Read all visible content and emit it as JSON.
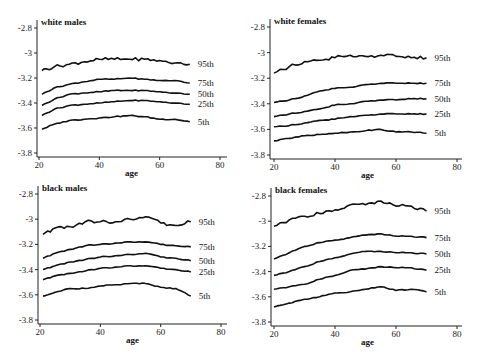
{
  "chart_data": [
    {
      "type": "line",
      "title": "white males",
      "xlabel": "age",
      "ylabel": "",
      "xlim": [
        20,
        80
      ],
      "ylim": [
        -3.8,
        -2.8
      ],
      "xticks": [
        20,
        40,
        60,
        80
      ],
      "yticks": [
        -2.8,
        -3,
        -3.2,
        -3.4,
        -3.6,
        -3.8
      ],
      "x": [
        21,
        25,
        30,
        35,
        40,
        45,
        50,
        55,
        60,
        65,
        70
      ],
      "series": [
        {
          "name": "95th",
          "values": [
            -3.14,
            -3.11,
            -3.09,
            -3.07,
            -3.05,
            -3.05,
            -3.05,
            -3.05,
            -3.06,
            -3.08,
            -3.09
          ]
        },
        {
          "name": "75th",
          "values": [
            -3.33,
            -3.28,
            -3.25,
            -3.23,
            -3.21,
            -3.21,
            -3.2,
            -3.21,
            -3.22,
            -3.22,
            -3.24
          ]
        },
        {
          "name": "50th",
          "values": [
            -3.42,
            -3.37,
            -3.33,
            -3.32,
            -3.31,
            -3.3,
            -3.3,
            -3.3,
            -3.31,
            -3.32,
            -3.33
          ]
        },
        {
          "name": "25th",
          "values": [
            -3.5,
            -3.45,
            -3.42,
            -3.41,
            -3.4,
            -3.39,
            -3.38,
            -3.38,
            -3.39,
            -3.4,
            -3.41
          ]
        },
        {
          "name": "5th",
          "values": [
            -3.61,
            -3.57,
            -3.54,
            -3.53,
            -3.52,
            -3.51,
            -3.5,
            -3.51,
            -3.53,
            -3.53,
            -3.55
          ]
        }
      ],
      "grid": false,
      "legend": "inline-right"
    },
    {
      "type": "line",
      "title": "white females",
      "xlabel": "age",
      "ylabel": "",
      "xlim": [
        20,
        80
      ],
      "ylim": [
        -3.8,
        -2.8
      ],
      "xticks": [
        20,
        40,
        60,
        80
      ],
      "yticks": [
        -2.8,
        -3,
        -3.2,
        -3.4,
        -3.6,
        -3.8
      ],
      "x": [
        20,
        25,
        30,
        35,
        40,
        45,
        50,
        55,
        60,
        65,
        70
      ],
      "series": [
        {
          "name": "95th",
          "values": [
            -3.16,
            -3.11,
            -3.07,
            -3.06,
            -3.04,
            -3.02,
            -3.03,
            -3.02,
            -3.03,
            -3.04,
            -3.04
          ]
        },
        {
          "name": "75th",
          "values": [
            -3.39,
            -3.37,
            -3.34,
            -3.3,
            -3.28,
            -3.27,
            -3.25,
            -3.24,
            -3.24,
            -3.24,
            -3.24
          ]
        },
        {
          "name": "50th",
          "values": [
            -3.5,
            -3.48,
            -3.46,
            -3.44,
            -3.41,
            -3.4,
            -3.38,
            -3.37,
            -3.37,
            -3.36,
            -3.36
          ]
        },
        {
          "name": "25th",
          "values": [
            -3.58,
            -3.57,
            -3.55,
            -3.53,
            -3.52,
            -3.5,
            -3.49,
            -3.48,
            -3.48,
            -3.48,
            -3.48
          ]
        },
        {
          "name": "5th",
          "values": [
            -3.69,
            -3.67,
            -3.65,
            -3.64,
            -3.63,
            -3.62,
            -3.61,
            -3.6,
            -3.62,
            -3.62,
            -3.63
          ]
        }
      ],
      "grid": false,
      "legend": "inline-right"
    },
    {
      "type": "line",
      "title": "black males",
      "xlabel": "age",
      "ylabel": "",
      "xlim": [
        20,
        80
      ],
      "ylim": [
        -3.8,
        -2.8
      ],
      "xticks": [
        20,
        40,
        60,
        80
      ],
      "yticks": [
        -2.8,
        -3,
        -3.2,
        -3.4,
        -3.6,
        -3.8
      ],
      "x": [
        21,
        25,
        30,
        35,
        40,
        45,
        50,
        55,
        60,
        65,
        70
      ],
      "series": [
        {
          "name": "95th",
          "values": [
            -3.12,
            -3.07,
            -3.06,
            -3.02,
            -3.02,
            -3.02,
            -3.0,
            -2.98,
            -3.03,
            -3.05,
            -3.02
          ]
        },
        {
          "name": "75th",
          "values": [
            -3.31,
            -3.27,
            -3.24,
            -3.21,
            -3.2,
            -3.19,
            -3.18,
            -3.18,
            -3.2,
            -3.21,
            -3.22
          ]
        },
        {
          "name": "50th",
          "values": [
            -3.4,
            -3.37,
            -3.34,
            -3.32,
            -3.3,
            -3.29,
            -3.28,
            -3.27,
            -3.3,
            -3.31,
            -3.33
          ]
        },
        {
          "name": "25th",
          "values": [
            -3.48,
            -3.45,
            -3.43,
            -3.41,
            -3.39,
            -3.38,
            -3.37,
            -3.37,
            -3.39,
            -3.4,
            -3.42
          ]
        },
        {
          "name": "5th",
          "values": [
            -3.61,
            -3.58,
            -3.55,
            -3.55,
            -3.53,
            -3.52,
            -3.51,
            -3.51,
            -3.54,
            -3.55,
            -3.61
          ]
        }
      ],
      "grid": false,
      "legend": "inline-right"
    },
    {
      "type": "line",
      "title": "black females",
      "xlabel": "age",
      "ylabel": "",
      "xlim": [
        20,
        80
      ],
      "ylim": [
        -3.8,
        -2.8
      ],
      "xticks": [
        20,
        40,
        60,
        80
      ],
      "yticks": [
        -2.8,
        -3,
        -3.2,
        -3.4,
        -3.6,
        -3.8
      ],
      "x": [
        20,
        25,
        30,
        35,
        40,
        45,
        50,
        55,
        60,
        65,
        70
      ],
      "series": [
        {
          "name": "95th",
          "values": [
            -3.04,
            -2.99,
            -2.96,
            -2.94,
            -2.91,
            -2.87,
            -2.87,
            -2.84,
            -2.88,
            -2.88,
            -2.92
          ]
        },
        {
          "name": "75th",
          "values": [
            -3.3,
            -3.25,
            -3.2,
            -3.17,
            -3.15,
            -3.13,
            -3.11,
            -3.1,
            -3.12,
            -3.12,
            -3.13
          ]
        },
        {
          "name": "50th",
          "values": [
            -3.43,
            -3.4,
            -3.36,
            -3.32,
            -3.29,
            -3.26,
            -3.24,
            -3.24,
            -3.25,
            -3.25,
            -3.26
          ]
        },
        {
          "name": "25th",
          "values": [
            -3.54,
            -3.52,
            -3.5,
            -3.46,
            -3.43,
            -3.39,
            -3.38,
            -3.36,
            -3.37,
            -3.37,
            -3.39
          ]
        },
        {
          "name": "5th",
          "values": [
            -3.68,
            -3.65,
            -3.62,
            -3.6,
            -3.57,
            -3.56,
            -3.54,
            -3.52,
            -3.55,
            -3.54,
            -3.56
          ]
        }
      ],
      "grid": false,
      "legend": "inline-right"
    }
  ],
  "panels": [
    {
      "title": "white males",
      "xlabel": "age",
      "series_labels": [
        "95th",
        "75th",
        "50th",
        "25th",
        "5th"
      ]
    },
    {
      "title": "white females",
      "xlabel": "age",
      "series_labels": [
        "95th",
        "75th",
        "50th",
        "25th",
        "5th"
      ]
    },
    {
      "title": "black males",
      "xlabel": "age",
      "series_labels": [
        "95th",
        "75th",
        "50th",
        "25th",
        "5th"
      ]
    },
    {
      "title": "black females",
      "xlabel": "age",
      "series_labels": [
        "95th",
        "75th",
        "50th",
        "25th",
        "5th"
      ]
    }
  ],
  "colors": {
    "line": "#111111",
    "axis": "#222222",
    "background": "#ffffff"
  }
}
